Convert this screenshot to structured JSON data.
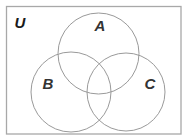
{
  "diagram": {
    "type": "venn",
    "universe": {
      "label": "U",
      "rect": {
        "x": 6,
        "y": 6,
        "width": 175,
        "height": 128
      },
      "stroke": "#a8a8a8",
      "label_color": "#1a1a1a"
    },
    "sets": [
      {
        "label": "A",
        "cx": 98.5,
        "cy": 53.5,
        "r": 40.5,
        "label_x": 100,
        "label_y": 31
      },
      {
        "label": "B",
        "cx": 71,
        "cy": 92,
        "r": 40,
        "label_x": 48,
        "label_y": 89
      },
      {
        "label": "C",
        "cx": 126,
        "cy": 92,
        "r": 39,
        "label_x": 150,
        "label_y": 89
      }
    ],
    "circle_stroke": "#9a9a9a",
    "label_color": "#333333"
  }
}
